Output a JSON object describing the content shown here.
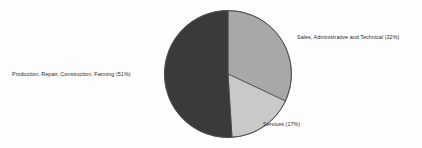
{
  "chart_data": {
    "type": "pie",
    "title": "",
    "subtitle": "",
    "xlabel": "",
    "ylabel": "",
    "legend_position": "none",
    "grid": false,
    "start_angle_deg": 0,
    "direction": "clockwise",
    "units": "percent",
    "categories": [
      "Sales, Administrative and Technical",
      "Services",
      "Production, Repair, Construction, Farming"
    ],
    "values": [
      32,
      17,
      51
    ],
    "slices": [
      {
        "label": "Sales, Administrative and Technical",
        "value": 32,
        "value_text": "32%",
        "label_text": "Sales, Administrative and Technical (32%)",
        "color": "#a8a8a8",
        "start_deg": 0,
        "end_deg": 115.2
      },
      {
        "label": "Services",
        "value": 17,
        "value_text": "17%",
        "label_text": "Services (17%)",
        "color": "#c9c9c9",
        "start_deg": 115.2,
        "end_deg": 176.4
      },
      {
        "label": "Production, Repair, Construction, Farming",
        "value": 51,
        "value_text": "51%",
        "label_text": "Production, Repair, Construction, Farming (51%)",
        "color": "#3a3a3a",
        "start_deg": 176.4,
        "end_deg": 360
      }
    ],
    "geometry": {
      "center_x": 228,
      "center_y": 74,
      "radius": 63.5
    },
    "style": {
      "background": "#fdfdfd",
      "outline_color": "#4a4a4a",
      "outline_width": 0.8,
      "label_color": "#2b2b2b"
    }
  }
}
